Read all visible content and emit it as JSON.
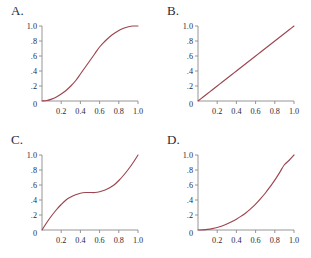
{
  "figure": {
    "background_color": "#ffffff",
    "curve_color": "#9d4550",
    "axis_color": "#8a8a8a",
    "label_color": "#2a2a3a"
  },
  "panels": [
    {
      "label": "A.",
      "name": "panel-a",
      "chart_data": {
        "type": "line",
        "title": "A.",
        "xlabel": "",
        "ylabel": "",
        "xlim": [
          0,
          1
        ],
        "ylim": [
          0,
          1
        ],
        "grid": false,
        "legend": "none",
        "xticks": [
          0.2,
          0.4,
          0.6,
          0.8,
          1.0
        ],
        "xtick_labels": [
          "0.2",
          "0.4",
          "0.6",
          "0.8",
          "1.0"
        ],
        "yticks": [
          0.2,
          0.4,
          0.6,
          0.8,
          1.0
        ],
        "ytick_labels": [
          ".2",
          ".4",
          ".6",
          ".8",
          "1.0"
        ],
        "origin_label": "0",
        "description": "sigmoid / S-shaped ease-in-out curve",
        "x": [
          0.0,
          0.05,
          0.1,
          0.15,
          0.2,
          0.25,
          0.3,
          0.35,
          0.4,
          0.45,
          0.5,
          0.55,
          0.6,
          0.65,
          0.7,
          0.75,
          0.8,
          0.85,
          0.9,
          0.95,
          1.0
        ],
        "values": [
          0.0,
          0.006,
          0.025,
          0.054,
          0.092,
          0.14,
          0.2,
          0.27,
          0.36,
          0.45,
          0.54,
          0.63,
          0.72,
          0.79,
          0.85,
          0.9,
          0.94,
          0.97,
          0.99,
          1.0,
          1.0
        ]
      }
    },
    {
      "label": "B.",
      "name": "panel-b",
      "chart_data": {
        "type": "line",
        "title": "B.",
        "xlabel": "",
        "ylabel": "",
        "xlim": [
          0,
          1
        ],
        "ylim": [
          0,
          1
        ],
        "grid": false,
        "legend": "none",
        "xticks": [
          0.2,
          0.4,
          0.6,
          0.8,
          1.0
        ],
        "xtick_labels": [
          "0.2",
          "0.4",
          "0.6",
          "0.8",
          "1.0"
        ],
        "yticks": [
          0.2,
          0.4,
          0.6,
          0.8,
          1.0
        ],
        "ytick_labels": [
          ".2",
          ".4",
          ".6",
          ".8",
          "1.0"
        ],
        "origin_label": "0",
        "description": "straight line, y equals x (linear)",
        "x": [
          0.0,
          0.05,
          0.1,
          0.15,
          0.2,
          0.25,
          0.3,
          0.35,
          0.4,
          0.45,
          0.5,
          0.55,
          0.6,
          0.65,
          0.7,
          0.75,
          0.8,
          0.85,
          0.9,
          0.95,
          1.0
        ],
        "values": [
          0.0,
          0.05,
          0.1,
          0.15,
          0.2,
          0.25,
          0.3,
          0.35,
          0.4,
          0.45,
          0.5,
          0.55,
          0.6,
          0.65,
          0.7,
          0.75,
          0.8,
          0.85,
          0.9,
          0.95,
          1.0
        ]
      }
    },
    {
      "label": "C.",
      "name": "panel-c",
      "chart_data": {
        "type": "line",
        "title": "C.",
        "xlabel": "",
        "ylabel": "",
        "xlim": [
          0,
          1
        ],
        "ylim": [
          0,
          1
        ],
        "grid": false,
        "legend": "none",
        "xticks": [
          0.2,
          0.4,
          0.6,
          0.8,
          1.0
        ],
        "xtick_labels": [
          "0.2",
          "0.4",
          "0.6",
          "0.8",
          "1.0"
        ],
        "yticks": [
          0.2,
          0.4,
          0.6,
          0.8,
          1.0
        ],
        "ytick_labels": [
          ".2",
          ".4",
          ".6",
          ".8",
          "1.0"
        ],
        "origin_label": "0",
        "description": "inverse sigmoid, steep at ends with plateau near 0.5 in the middle",
        "x": [
          0.0,
          0.05,
          0.1,
          0.15,
          0.2,
          0.25,
          0.3,
          0.35,
          0.4,
          0.45,
          0.5,
          0.55,
          0.6,
          0.65,
          0.7,
          0.75,
          0.8,
          0.85,
          0.9,
          0.95,
          1.0
        ],
        "values": [
          0.0,
          0.1,
          0.19,
          0.27,
          0.34,
          0.4,
          0.44,
          0.47,
          0.49,
          0.5,
          0.5,
          0.5,
          0.51,
          0.53,
          0.56,
          0.6,
          0.66,
          0.73,
          0.81,
          0.9,
          1.0
        ]
      }
    },
    {
      "label": "D.",
      "name": "panel-d",
      "chart_data": {
        "type": "line",
        "title": "D.",
        "xlabel": "",
        "ylabel": "",
        "xlim": [
          0,
          1
        ],
        "ylim": [
          0,
          1
        ],
        "grid": false,
        "legend": "none",
        "xticks": [
          0.2,
          0.4,
          0.6,
          0.8,
          1.0
        ],
        "xtick_labels": [
          "0.2",
          "0.4",
          "0.6",
          "0.8",
          "1.0"
        ],
        "yticks": [
          0.2,
          0.4,
          0.6,
          0.8,
          1.0
        ],
        "ytick_labels": [
          ".2",
          ".4",
          ".6",
          ".8",
          "1.0"
        ],
        "origin_label": "0",
        "description": "convex increasing power curve, ease-in (approximately x squared)",
        "x": [
          0.0,
          0.05,
          0.1,
          0.15,
          0.2,
          0.25,
          0.3,
          0.35,
          0.4,
          0.45,
          0.5,
          0.55,
          0.6,
          0.65,
          0.7,
          0.75,
          0.8,
          0.85,
          0.9,
          0.95,
          1.0
        ],
        "values": [
          0.0,
          0.002,
          0.008,
          0.019,
          0.034,
          0.054,
          0.079,
          0.11,
          0.145,
          0.185,
          0.23,
          0.285,
          0.345,
          0.415,
          0.49,
          0.575,
          0.665,
          0.765,
          0.87,
          0.93,
          1.0
        ]
      }
    }
  ]
}
